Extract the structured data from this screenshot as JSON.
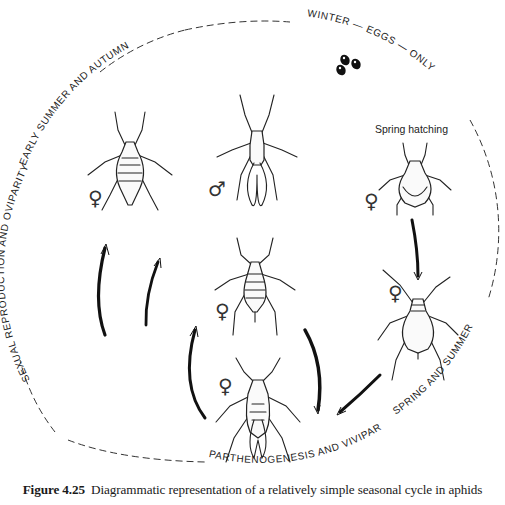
{
  "ring_labels": {
    "top": "WINTER — EGGS — ONLY",
    "right_bottom": "SPRING AND SUMMER",
    "bottom": "PARTHENOGENESIS AND VIVIPARITY",
    "left": "SEXUAL REPRODUCTION AND OVIPARITY",
    "upper_left": "EARLY SUMMER AND AUTUMN"
  },
  "annotations": {
    "spring_hatching": "Spring hatching"
  },
  "symbols": {
    "female": "♀",
    "male": "♂"
  },
  "aphids": [
    {
      "id": "oviparous-female",
      "sex": "♀",
      "position": "upper-left"
    },
    {
      "id": "winged-male",
      "sex": "♂",
      "position": "upper-center"
    },
    {
      "id": "fundatrix",
      "sex": "♀",
      "position": "upper-right",
      "label": "Spring hatching"
    },
    {
      "id": "apterous-viviparous-female-right",
      "sex": "♀",
      "position": "middle-right"
    },
    {
      "id": "apterous-viviparous-female-center",
      "sex": "♀",
      "position": "center"
    },
    {
      "id": "alate-viviparous-female",
      "sex": "♀",
      "position": "lower-center"
    }
  ],
  "caption": {
    "figure_number": "Figure 4.25",
    "text": "Diagrammatic representation of a relatively simple seasonal cycle in aphids"
  }
}
